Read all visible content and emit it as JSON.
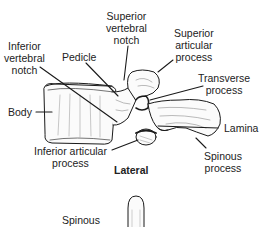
{
  "diagram": {
    "view_caption": "Lateral",
    "labels": {
      "superior_vertebral_notch": [
        "Superior",
        "vertebral",
        "notch"
      ],
      "superior_articular_process": [
        "Superior",
        "articular",
        "process"
      ],
      "inferior_vertebral_notch": [
        "Inferior",
        "vertebral",
        "notch"
      ],
      "pedicle": "Pedicle",
      "transverse_process": [
        "Transverse",
        "process"
      ],
      "body": "Body",
      "lamina": "Lamina",
      "inferior_articular_process": [
        "Inferior articular",
        "process"
      ],
      "spinous_process": [
        "Spinous",
        "process"
      ],
      "spinous_lower": "Spinous"
    },
    "colors": {
      "line": "#1a1a1a",
      "text": "#222222",
      "background": "#ffffff"
    }
  }
}
